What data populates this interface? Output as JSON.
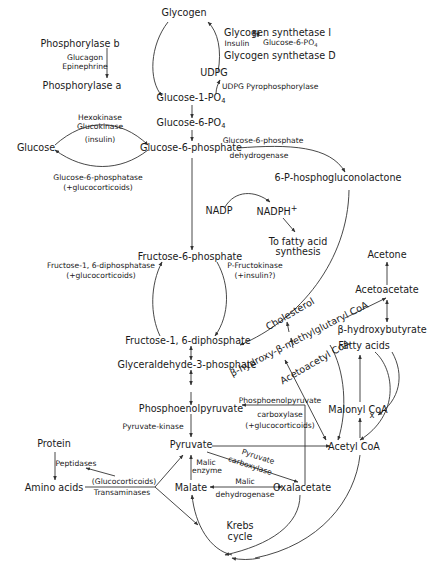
{
  "nodes": {
    "glycogen": "Glycogen",
    "phosphorylase_b": "Phosphorylase b",
    "phosphorylase_a": "Phosphorylase a",
    "glycogen_synthetase_i": "Glycogen synthetase I",
    "glycogen_synthetase_d": "Glycogen synthetase D",
    "udpg": "UDPG",
    "glucose_1_po4": "Glucose-1-PO",
    "glucose_6_po4": "Glucose-6-PO",
    "po4_sub": "4",
    "glucose": "Glucose",
    "glucose_6_phosphate": "Glucose-6-phosphate",
    "p_gluconolactone": "6-P-hosphogluconolactone",
    "nadp": "NADP",
    "nadph": "NADPH",
    "nadph_sup": "+",
    "fatty_acid_synthesis_1": "To fatty acid",
    "fatty_acid_synthesis_2": "synthesis",
    "fructose_6_phosphate": "Fructose-6-phosphate",
    "fructose_1_6_diphosphate": "Fructose-1, 6-diphosphate",
    "glyceraldehyde_3_phosphate": "Glyceraldehyde-3-phosphate",
    "acetone": "Acetone",
    "acetoacetate": "Acetoacetate",
    "b_hydroxybutyrate": "β-hydroxybutyrate",
    "cholesterol": "Cholesterol",
    "hmg_coa": "β-hydroxy-β-methylglutaryl CoA",
    "acetoacetyl_coa": "Acetoacetyl CoA",
    "fatty_acids": "Fatty acids",
    "malonyl_coa": "Malonyl CoA",
    "acetyl_coa": "Acetyl CoA",
    "phosphoenolpyruvate": "Phosphoenolpyruvate",
    "pyruvate": "Pyruvate",
    "protein": "Protein",
    "amino_acids": "Amino acids",
    "malate": "Malate",
    "oxalacetate": "Oxalacetate",
    "krebs_1": "Krebs",
    "krebs_2": "cycle",
    "inhibit_mark": "x"
  },
  "enzymes": {
    "glucagon": "Glucagon",
    "epinephrine": "Epinephrine",
    "insulin_reg": "Insulin",
    "g6p_reg": "Glucose-6-PO",
    "udpg_pyrophosphorylase": "UDPG Pyrophosphorylase",
    "hexokinase": "Hexokinase",
    "glucokinase": "Glucokinase",
    "insulin_paren": "(insulin)",
    "g6_phosphatase": "Glucose-6-phosphatase",
    "g6_phosphatase_reg": "(+glucocorticoids)",
    "g6pd_1": "Glucose-6-phosphate",
    "g6pd_2": "dehydrogenase",
    "f16_diphosphatase": "Fructose-1, 6-diphosphatase",
    "f16_diphosphatase_reg": "(+glucocorticoids)",
    "p_fructokinase": "P-Fructokinase",
    "p_fructokinase_reg": "(+insulin?)",
    "pep_carboxylase_1": "Phosphoenolpyruvate",
    "pep_carboxylase_2": "carboxylase",
    "pep_carboxylase_reg": "(+glucocorticoids)",
    "pyruvate_kinase": "Pyruvate-kinase",
    "peptidases": "Peptidases",
    "glucocorticoids": "(Glucocorticoids)",
    "transaminases": "Transaminases",
    "malic_enzyme_1": "Malic",
    "malic_enzyme_2": "enzyme",
    "pyruvate_carboxylase_1": "Pyruvate",
    "pyruvate_carboxylase_2": "carboxylase",
    "malic_dh_1": "Malic",
    "malic_dh_2": "dehydrogenase"
  },
  "colors": {
    "line": "#333333",
    "text": "#1a1a1a",
    "background": "#ffffff"
  }
}
